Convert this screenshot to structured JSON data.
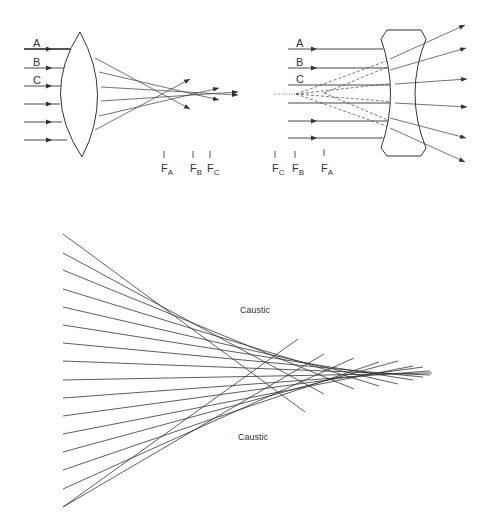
{
  "converging_lens": {
    "ray_labels": [
      "A",
      "B",
      "C"
    ],
    "focal_points": [
      {
        "label": "F",
        "sub": "A"
      },
      {
        "label": "F",
        "sub": "B"
      },
      {
        "label": "F",
        "sub": "C"
      }
    ]
  },
  "diverging_lens": {
    "ray_labels": [
      "A",
      "B",
      "C"
    ],
    "focal_points": [
      {
        "label": "F",
        "sub": "C"
      },
      {
        "label": "F",
        "sub": "B"
      },
      {
        "label": "F",
        "sub": "A"
      }
    ]
  },
  "caustic_diagram": {
    "labels": {
      "upper": "Caustic",
      "lower": "Caustic"
    },
    "ray_count": 16
  },
  "colors": {
    "line": "#333333",
    "background": "#ffffff"
  }
}
